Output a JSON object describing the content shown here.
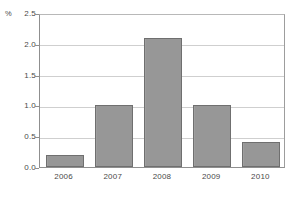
{
  "chart_data": {
    "type": "bar",
    "title": "",
    "xlabel": "",
    "ylabel": "%",
    "categories": [
      "2006",
      "2007",
      "2008",
      "2009",
      "2010"
    ],
    "values": [
      0.2,
      1.0,
      2.1,
      1.0,
      0.4
    ],
    "ylim": [
      0.0,
      2.5
    ],
    "ytick_labels": [
      "0.0",
      "0.5",
      "1.0",
      "1.5",
      "2.0",
      "2.5"
    ],
    "ytick_values": [
      0.0,
      0.5,
      1.0,
      1.5,
      2.0,
      2.5
    ],
    "grid": true,
    "legend": false,
    "series": [
      {
        "name": "",
        "values": [
          0.2,
          1.0,
          2.1,
          1.0,
          0.4
        ]
      }
    ],
    "colors": {
      "bar_fill": "#9a9a9a",
      "bar_border": "#6f6f6f",
      "gridline": "#cfcfcf",
      "axis": "#8f8f8f",
      "background": "#ffffff",
      "text": "#4a4a4a"
    }
  }
}
